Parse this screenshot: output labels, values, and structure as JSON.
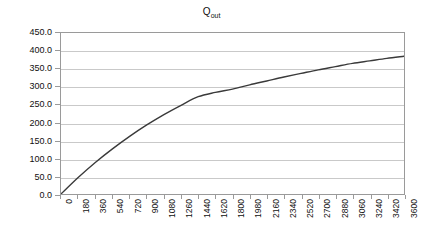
{
  "chart_data": {
    "type": "line",
    "title": "Qout",
    "title_base": "Q",
    "title_subscript": "out",
    "xlabel": "",
    "ylabel": "",
    "xlim": [
      0,
      3600
    ],
    "ylim": [
      0,
      450
    ],
    "grid": true,
    "legend": "none",
    "line_color": "#3a3a3a",
    "grid_color": "#c9c9c9",
    "axis_color": "#9a9a9a",
    "y_ticks": [
      "0.0",
      "50.0",
      "100.0",
      "150.0",
      "200.0",
      "250.0",
      "300.0",
      "350.0",
      "400.0",
      "450.0"
    ],
    "y_tick_values": [
      0,
      50,
      100,
      150,
      200,
      250,
      300,
      350,
      400,
      450
    ],
    "x_ticks": [
      "0",
      "180",
      "360",
      "540",
      "720",
      "900",
      "1080",
      "1260",
      "1440",
      "1620",
      "1800",
      "1980",
      "2160",
      "2340",
      "2520",
      "2700",
      "2880",
      "3060",
      "3240",
      "3420",
      "3600"
    ],
    "x": [
      0,
      180,
      360,
      540,
      720,
      900,
      1080,
      1260,
      1440,
      1620,
      1800,
      1980,
      2160,
      2340,
      2520,
      2700,
      2880,
      3060,
      3240,
      3420,
      3600
    ],
    "values": [
      0,
      46,
      88,
      126,
      161,
      193,
      222,
      248,
      272,
      284,
      293,
      305,
      316,
      327,
      337,
      347,
      356,
      365,
      372,
      379,
      385
    ],
    "series": [
      {
        "name": "Qout",
        "values": [
          0,
          46,
          88,
          126,
          161,
          193,
          222,
          248,
          272,
          284,
          293,
          305,
          316,
          327,
          337,
          347,
          356,
          365,
          372,
          379,
          385
        ]
      }
    ]
  }
}
